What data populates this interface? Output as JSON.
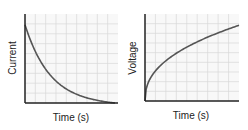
{
  "chart_data": [
    {
      "type": "line",
      "title": "",
      "xlabel": "Time (s)",
      "ylabel": "Current",
      "grid": true,
      "series": [
        {
          "name": "Current",
          "shape": "exponential decay",
          "x": [
            0,
            1,
            2,
            3,
            4,
            5,
            6,
            7,
            8,
            9
          ],
          "values": [
            0.88,
            0.62,
            0.44,
            0.31,
            0.2,
            0.12,
            0.07,
            0.03,
            0.01,
            0.0
          ]
        }
      ],
      "xlim": [
        0,
        9
      ],
      "ylim": [
        0,
        1
      ],
      "tick_labels": false
    },
    {
      "type": "line",
      "title": "",
      "xlabel": "Time (s)",
      "ylabel": "Voltage",
      "grid": true,
      "series": [
        {
          "name": "Voltage",
          "shape": "logarithmic rise",
          "x": [
            0,
            1,
            2,
            3,
            4,
            5,
            6,
            7,
            8,
            9
          ],
          "values": [
            0.0,
            0.4,
            0.52,
            0.6,
            0.67,
            0.72,
            0.77,
            0.81,
            0.84,
            0.87
          ]
        }
      ],
      "xlim": [
        0,
        9
      ],
      "ylim": [
        0,
        1
      ],
      "tick_labels": false
    }
  ],
  "charts": {
    "left": {
      "xlabel": "Time (s)",
      "ylabel": "Current"
    },
    "right": {
      "xlabel": "Time (s)",
      "ylabel": "Voltage"
    }
  },
  "colors": {
    "curve": "#555555",
    "grid": "#d9d9d9",
    "axis": "#222222",
    "background": "#f7f7f7"
  }
}
